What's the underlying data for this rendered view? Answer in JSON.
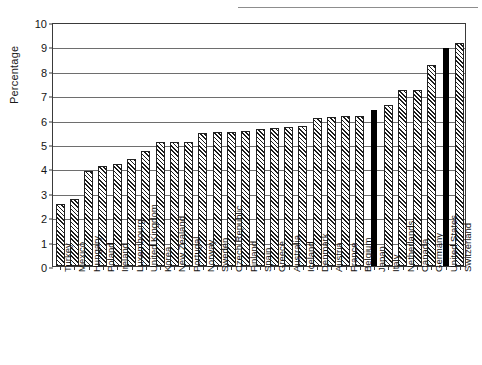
{
  "chart_data": {
    "type": "bar",
    "title": "",
    "xlabel": "",
    "ylabel": "Percentage",
    "ylim": [
      0,
      10
    ],
    "ytick_values": [
      0,
      1,
      2,
      3,
      4,
      5,
      6,
      7,
      8,
      9,
      10
    ],
    "ytick_labels": [
      "0",
      "1",
      "2",
      "3",
      "4",
      "5",
      "6",
      "7",
      "8",
      "9",
      "10"
    ],
    "grid": true,
    "legend": "none",
    "bar_style": {
      "default_fill": "diagonal-hatch",
      "highlight_fill": "solid-black",
      "highlight_color": "#000000",
      "edge_color": "#222222"
    },
    "categories": [
      "Turkey",
      "Mexico",
      "Hungary",
      "Poland",
      "Ireland",
      "Luxembourg",
      "United Kingdom",
      "Korea",
      "New Zealand",
      "Portugal",
      "Norway",
      "Sweden",
      "Czech Republic",
      "Finland",
      "Spain",
      "Greece",
      "Australia",
      "Iceland",
      "Denmark",
      "Austria",
      "France",
      "Belgium",
      "Japan",
      "Italy",
      "Netherlands",
      "Canada",
      "Germany",
      "United States",
      "Switzerland"
    ],
    "values": [
      2.55,
      2.75,
      3.9,
      4.1,
      4.2,
      4.4,
      4.7,
      5.1,
      5.1,
      5.1,
      5.45,
      5.5,
      5.5,
      5.55,
      5.6,
      5.65,
      5.7,
      5.75,
      6.05,
      6.1,
      6.15,
      6.15,
      6.4,
      6.6,
      7.2,
      7.2,
      8.25,
      8.95,
      9.15
    ],
    "highlighted": [
      "Japan",
      "United States"
    ]
  }
}
